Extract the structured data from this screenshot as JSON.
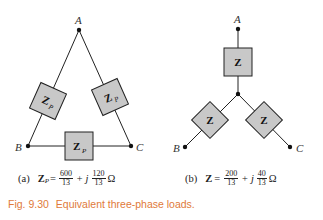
{
  "figure": {
    "number": "Fig. 9.30",
    "title": "Equivalent three-phase loads.",
    "caption_color": "#e07a3a"
  },
  "delta": {
    "nodes": {
      "a": "A",
      "b": "B",
      "c": "C"
    },
    "impedance_label": "Z",
    "impedance_subscript": "P",
    "box_fill": "#c8c8c8",
    "caption": {
      "tag": "(a)",
      "symbol": "Z",
      "subscript": "P",
      "equals": "=",
      "real_num": "600",
      "real_den": "13",
      "plus_j": "+ j",
      "imag_num": "120",
      "imag_den": "13",
      "unit": "Ω"
    }
  },
  "wye": {
    "nodes": {
      "a": "A",
      "b": "B",
      "c": "C"
    },
    "impedance_label": "Z",
    "box_fill": "#c8c8c8",
    "caption": {
      "tag": "(b)",
      "symbol": "Z",
      "equals": "=",
      "real_num": "200",
      "real_den": "13",
      "plus_j": "+ j",
      "imag_num": "40",
      "imag_den": "13",
      "unit": "Ω"
    }
  }
}
